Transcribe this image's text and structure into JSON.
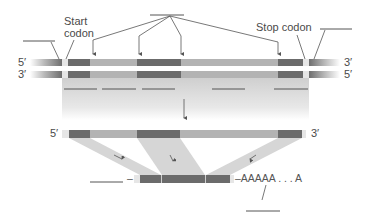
{
  "diagram": {
    "title": "",
    "labels": {
      "start_codon_line1": "Start",
      "start_codon_line2": "codon",
      "stop_codon": "Stop codon",
      "dna_top_left": "5′",
      "dna_bottom_left": "3′",
      "dna_top_right": "3′",
      "dna_bottom_right": "5′",
      "premrna_left": "5′",
      "premrna_right": "3′",
      "mrna_cap_dash": "–",
      "poly_a_tail": "–AAAAA . . . A"
    },
    "blank_label_lines": [
      {
        "name": "left-flank-blank",
        "x1": 23,
        "y1": 41,
        "x2": 55,
        "y2": 41
      },
      {
        "name": "exon-group-blank",
        "x1": 150,
        "y1": 15,
        "x2": 184,
        "y2": 15
      },
      {
        "name": "right-flank-blank",
        "x1": 320,
        "y1": 29,
        "x2": 352,
        "y2": 29
      },
      {
        "name": "five-prime-cap-blank",
        "x1": 90,
        "y1": 182,
        "x2": 123,
        "y2": 182
      },
      {
        "name": "poly-a-blank",
        "x1": 246,
        "y1": 211,
        "x2": 280,
        "y2": 211
      }
    ],
    "transcription_blanks": [
      {
        "x1": 64,
        "x2": 97
      },
      {
        "x1": 102,
        "x2": 136
      },
      {
        "x1": 142,
        "x2": 175
      },
      {
        "x1": 212,
        "x2": 245
      },
      {
        "x1": 274,
        "x2": 308
      }
    ],
    "colors": {
      "exon": "#6b6b6b",
      "intron": "#b3b3b3",
      "codon_gap": "#e6e6e6",
      "flank_dark": "#7a7a7a",
      "shade": "#d6d6d6",
      "line": "#555555",
      "text": "#4a4a4a"
    },
    "dna": {
      "x_start": 30,
      "x_end": 340,
      "top_strand_y": 59,
      "bottom_strand_y": 71,
      "strand_height": 7,
      "segments": [
        {
          "type": "flank",
          "x": 30,
          "w": 32
        },
        {
          "type": "codon_gap",
          "x": 62,
          "w": 6
        },
        {
          "type": "exon",
          "x": 68,
          "w": 22
        },
        {
          "type": "intron",
          "x": 90,
          "w": 47
        },
        {
          "type": "exon",
          "x": 137,
          "w": 44
        },
        {
          "type": "intron",
          "x": 181,
          "w": 97
        },
        {
          "type": "exon",
          "x": 278,
          "w": 25
        },
        {
          "type": "codon_gap",
          "x": 303,
          "w": 6
        },
        {
          "type": "flank_right",
          "x": 309,
          "w": 31
        }
      ]
    },
    "pre_mrna": {
      "y": 130,
      "height": 8,
      "segments": [
        {
          "type": "codon_gap",
          "x": 62,
          "w": 7
        },
        {
          "type": "exon",
          "x": 69,
          "w": 21
        },
        {
          "type": "intron",
          "x": 90,
          "w": 47
        },
        {
          "type": "exon",
          "x": 137,
          "w": 43
        },
        {
          "type": "intron",
          "x": 180,
          "w": 98
        },
        {
          "type": "exon",
          "x": 278,
          "w": 24
        },
        {
          "type": "codon_gap",
          "x": 302,
          "w": 4
        }
      ]
    },
    "mrna": {
      "y": 175,
      "height": 8,
      "segments": [
        {
          "type": "codon_gap",
          "x": 134,
          "w": 6
        },
        {
          "type": "exon",
          "x": 140,
          "w": 21
        },
        {
          "type": "exon",
          "x": 162,
          "w": 43
        },
        {
          "type": "exon",
          "x": 206,
          "w": 24
        },
        {
          "type": "codon_gap",
          "x": 230,
          "w": 4
        }
      ]
    }
  }
}
